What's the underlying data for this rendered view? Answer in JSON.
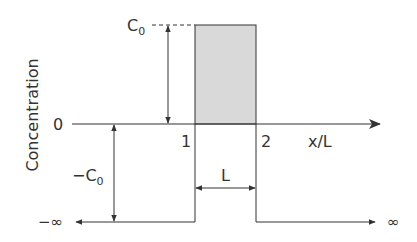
{
  "diagram": {
    "type": "concentration-profile",
    "ylabel": "Concentration",
    "xlabel": "x/L",
    "y_ticks": {
      "zero": "0",
      "c0": "C",
      "c0_sub": "0",
      "neg_c0": "−C",
      "neg_c0_sub": "0"
    },
    "x_ticks": [
      "1",
      "2"
    ],
    "width_label": "L",
    "neg_inf": "−∞",
    "pos_inf": "∞",
    "colors": {
      "line": "#333333",
      "fill": "#d9d9d9"
    }
  }
}
